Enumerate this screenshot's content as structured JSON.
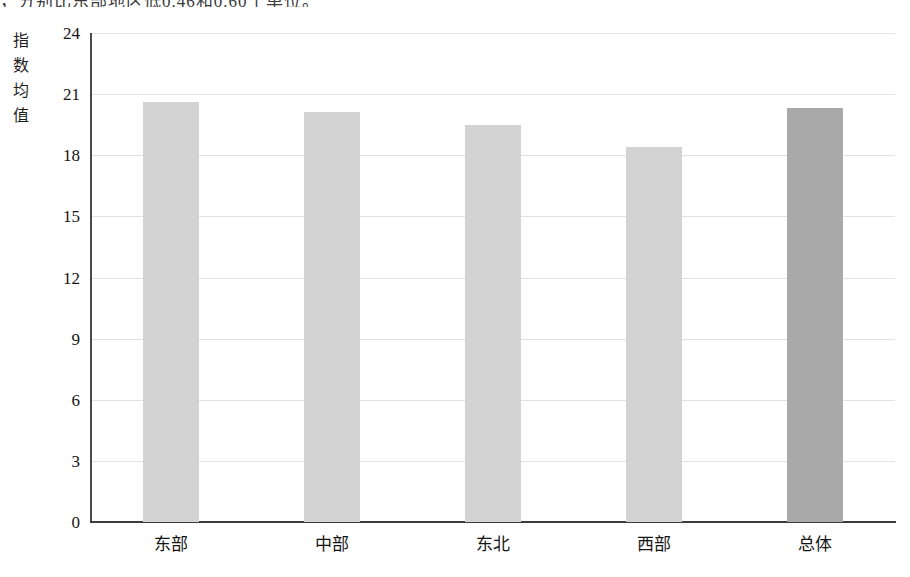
{
  "page": {
    "clipped_top_line": "，分别比东部地区低0.46和0.60个单位。"
  },
  "chart_data": {
    "type": "bar",
    "title": "",
    "xlabel": "",
    "ylabel": "指数均值",
    "categories": [
      "东部",
      "中部",
      "东北",
      "西部",
      "总体"
    ],
    "values": [
      20.6,
      20.1,
      19.5,
      18.4,
      20.3
    ],
    "ylim": [
      0,
      24
    ],
    "yticks": [
      "0",
      "3",
      "6",
      "9",
      "12",
      "15",
      "18",
      "21",
      "24"
    ],
    "ytick_values": [
      0,
      3,
      6,
      9,
      12,
      15,
      18,
      21,
      24
    ],
    "grid": true,
    "legend": "none",
    "series": [
      {
        "name": "指数均值",
        "values": [
          20.6,
          20.1,
          19.5,
          18.4,
          20.3
        ]
      }
    ],
    "bar_colors": [
      "#cfcfcf",
      "#cfcfcf",
      "#cfcfcf",
      "#cfcfcf",
      "#a9a9a9"
    ],
    "highlight_index": 4,
    "colors": {
      "bar_default": "#cfcfcf",
      "bar_highlight": "#a9a9a9",
      "gridline": "#dfe3e6",
      "axis": "#3c3c3c",
      "text": "#151515"
    }
  }
}
